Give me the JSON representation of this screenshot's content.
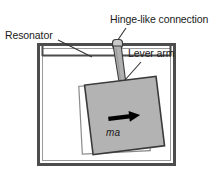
{
  "figure": {
    "type": "schematic-diagram",
    "background_color": "#ffffff"
  },
  "labels": {
    "resonator": "Resonator",
    "hinge": "Hinge-like connection",
    "lever_arm": "Lever arm",
    "force": "ma"
  },
  "colors": {
    "outline": "#4d4d4d",
    "mass_fill": "#b3b3b3",
    "mass_stroke": "#3a3a3a",
    "ghost_stroke": "#808080",
    "arrow": "#000000",
    "leader": "#333333",
    "text": "#1a1a1a"
  },
  "geometry": {
    "housing": {
      "x": 37,
      "y": 43,
      "width": 139,
      "height": 123,
      "stroke_width": 3
    },
    "top_plate_y": 55,
    "hinge": {
      "cx": 117,
      "cy": 44,
      "width": 10,
      "height": 9
    },
    "lever_arm": {
      "top_x": 117,
      "top_y": 47,
      "bottom_x": 124,
      "bottom_y": 96,
      "top_half_width": 4,
      "bottom_half_width": 3
    },
    "mass_ghost": {
      "x": 80,
      "y": 84,
      "width": 68,
      "height": 68,
      "rotation_deg": -3
    },
    "mass_active": {
      "x": 88,
      "y": 80,
      "width": 72,
      "height": 70,
      "rotation_deg": -7
    },
    "arrow": {
      "x1": 108,
      "y1": 118,
      "x2": 137,
      "y2": 115
    }
  }
}
